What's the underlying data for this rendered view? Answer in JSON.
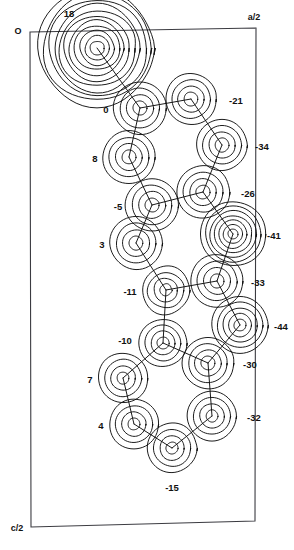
{
  "figure": {
    "type": "contour-map",
    "frame": {
      "corner_label_origin": "O",
      "corner_label_top_right": "a/2",
      "corner_label_bottom_left": "c/2"
    }
  },
  "chart_data": {
    "type": "heatmap",
    "title": "",
    "xlabel": "a/2",
    "ylabel": "c/2",
    "grid": false,
    "legend": "none",
    "contour_units": "e/A^3 x 100",
    "frame_corners_px": [
      [
        30,
        32
      ],
      [
        256,
        28
      ],
      [
        255,
        521
      ],
      [
        31,
        527
      ]
    ],
    "atoms": [
      {
        "id": "A1",
        "label": "18",
        "value": 18,
        "x": 97,
        "y": 48,
        "rings": 11,
        "r0": 7,
        "dr": 5.2,
        "label_dx": -28,
        "label_dy": -34,
        "label_anchor": "middle",
        "wiggly": true
      },
      {
        "id": "A2",
        "label": "0",
        "value": 0,
        "x": 140,
        "y": 108,
        "rings": 4,
        "r0": 7,
        "dr": 6.5,
        "label_dx": -34,
        "label_dy": 2,
        "label_anchor": "middle",
        "wiggly": false
      },
      {
        "id": "A3",
        "label": "-21",
        "value": -21,
        "x": 191,
        "y": 99,
        "rings": 4,
        "r0": 7,
        "dr": 6.2,
        "label_dx": 38,
        "label_dy": 2,
        "label_anchor": "start",
        "wiggly": false
      },
      {
        "id": "A4",
        "label": "34",
        "value": -34,
        "x": 222,
        "y": 145,
        "rings": 4,
        "r0": 7,
        "dr": 6.2,
        "label_dx": 33,
        "label_dy": 2,
        "label_anchor": "start",
        "wiggly": false,
        "label_text": "-34"
      },
      {
        "id": "A5",
        "label": "8",
        "value": 8,
        "x": 129,
        "y": 157,
        "rings": 4,
        "r0": 7,
        "dr": 6.5,
        "label_dx": -34,
        "label_dy": 2,
        "label_anchor": "middle",
        "wiggly": false
      },
      {
        "id": "A6",
        "label": "-26",
        "value": -26,
        "x": 203,
        "y": 192,
        "rings": 4,
        "r0": 7,
        "dr": 6.5,
        "label_dx": 38,
        "label_dy": 2,
        "label_anchor": "start",
        "wiggly": false
      },
      {
        "id": "A7",
        "label": "-5",
        "value": -5,
        "x": 152,
        "y": 205,
        "rings": 4,
        "r0": 7,
        "dr": 6.5,
        "label_dx": -34,
        "label_dy": 2,
        "label_anchor": "middle",
        "wiggly": false
      },
      {
        "id": "A8",
        "label": "-41",
        "value": -41,
        "x": 233,
        "y": 234,
        "rings": 7,
        "r0": 5,
        "dr": 4.6,
        "label_dx": 34,
        "label_dy": 2,
        "label_anchor": "start",
        "wiggly": false
      },
      {
        "id": "A9",
        "label": "3",
        "value": 3,
        "x": 136,
        "y": 243,
        "rings": 4,
        "r0": 7,
        "dr": 6.5,
        "label_dx": -34,
        "label_dy": 2,
        "label_anchor": "middle",
        "wiggly": false
      },
      {
        "id": "A10",
        "label": "-33",
        "value": -33,
        "x": 217,
        "y": 281,
        "rings": 4,
        "r0": 7,
        "dr": 6.5,
        "label_dx": 34,
        "label_dy": 2,
        "label_anchor": "start",
        "wiggly": false
      },
      {
        "id": "A11",
        "label": "-11",
        "value": -11,
        "x": 166,
        "y": 290,
        "rings": 4,
        "r0": 6,
        "dr": 6.0,
        "label_dx": -36,
        "label_dy": 2,
        "label_anchor": "middle",
        "wiggly": true
      },
      {
        "id": "A12",
        "label": "-44",
        "value": -44,
        "x": 240,
        "y": 325,
        "rings": 5,
        "r0": 6,
        "dr": 5.6,
        "label_dx": 34,
        "label_dy": 2,
        "label_anchor": "start",
        "wiggly": false
      },
      {
        "id": "A13",
        "label": "-10",
        "value": -10,
        "x": 163,
        "y": 343,
        "rings": 4,
        "r0": 6,
        "dr": 6.0,
        "label_dx": -38,
        "label_dy": -2,
        "label_anchor": "middle",
        "wiggly": false
      },
      {
        "id": "A14",
        "label": "-30",
        "value": -30,
        "x": 208,
        "y": 363,
        "rings": 4,
        "r0": 7,
        "dr": 6.3,
        "label_dx": 35,
        "label_dy": 2,
        "label_anchor": "start",
        "wiggly": false
      },
      {
        "id": "A15",
        "label": "7",
        "value": 7,
        "x": 123,
        "y": 378,
        "rings": 4,
        "r0": 6,
        "dr": 6.3,
        "label_dx": -33,
        "label_dy": 2,
        "label_anchor": "middle",
        "wiggly": false
      },
      {
        "id": "A16",
        "label": "-32",
        "value": -32,
        "x": 212,
        "y": 416,
        "rings": 4,
        "r0": 6,
        "dr": 6.3,
        "label_dx": 35,
        "label_dy": 2,
        "label_anchor": "start",
        "wiggly": false
      },
      {
        "id": "A17",
        "label": "4",
        "value": 4,
        "x": 134,
        "y": 424,
        "rings": 4,
        "r0": 6,
        "dr": 6.3,
        "label_dx": -33,
        "label_dy": 2,
        "label_anchor": "middle",
        "wiggly": false
      },
      {
        "id": "A18",
        "label": "-15",
        "value": -15,
        "x": 172,
        "y": 448,
        "rings": 4,
        "r0": 6,
        "dr": 6.3,
        "label_dx": 0,
        "label_dy": 40,
        "label_anchor": "middle",
        "wiggly": false
      }
    ],
    "bonds": [
      [
        "A1",
        "A2"
      ],
      [
        "A2",
        "A3"
      ],
      [
        "A3",
        "A4"
      ],
      [
        "A4",
        "A6"
      ],
      [
        "A2",
        "A5"
      ],
      [
        "A5",
        "A7"
      ],
      [
        "A7",
        "A6"
      ],
      [
        "A6",
        "A8"
      ],
      [
        "A7",
        "A9"
      ],
      [
        "A9",
        "A11"
      ],
      [
        "A11",
        "A10"
      ],
      [
        "A10",
        "A8"
      ],
      [
        "A10",
        "A12"
      ],
      [
        "A11",
        "A13"
      ],
      [
        "A13",
        "A14"
      ],
      [
        "A14",
        "A12"
      ],
      [
        "A13",
        "A15"
      ],
      [
        "A15",
        "A17"
      ],
      [
        "A17",
        "A18"
      ],
      [
        "A18",
        "A16"
      ],
      [
        "A16",
        "A14"
      ]
    ]
  },
  "labels": {
    "origin": "O",
    "a_half": "a/2",
    "c_half": "c/2"
  }
}
